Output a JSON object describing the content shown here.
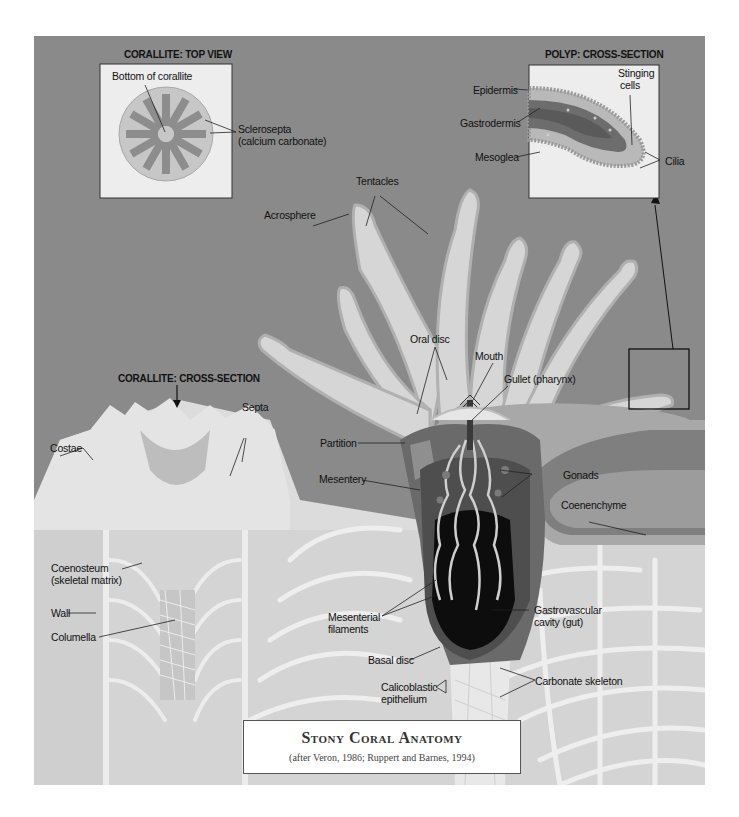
{
  "diagram": {
    "title": "Stony Coral Anatomy",
    "subtitle": "(after Veron, 1986; Ruppert and Barnes, 1994)",
    "colors": {
      "background": "#8a8a8a",
      "tissue_light": "#d6d6d6",
      "tissue_mid": "#b2b2b2",
      "tissue_dark": "#5e5e5e",
      "cavity": "#0d0d0d",
      "skeleton": "#e2e2e2",
      "inset_bg": "#ededed"
    },
    "insets": {
      "top_view": {
        "heading": "CORALLITE: TOP VIEW",
        "labels": {
          "bottom": "Bottom of corallite",
          "sclerosepta_1": "Sclerosepta",
          "sclerosepta_2": "(calcium carbonate)"
        }
      },
      "polyp_section": {
        "heading": "POLYP: CROSS-SECTION",
        "labels": {
          "stinging_1": "Stinging",
          "stinging_2": "cells",
          "epidermis": "Epidermis",
          "gastrodermis": "Gastrodermis",
          "mesoglea": "Mesoglea",
          "cilia": "Cilia"
        }
      }
    },
    "cross_section_heading": "CORALLITE: CROSS-SECTION",
    "labels": {
      "tentacles": "Tentacles",
      "acrosphere": "Acrosphere",
      "oral_disc": "Oral disc",
      "mouth": "Mouth",
      "gullet": "Gullet (pharynx)",
      "septa": "Septa",
      "costae": "Costae",
      "partition": "Partition",
      "mesentery": "Mesentery",
      "gonads": "Gonads",
      "coenenchyme": "Coenenchyme",
      "coenosteum_1": "Coenosteum",
      "coenosteum_2": "(skeletal matrix)",
      "wall": "Wall",
      "columella": "Columella",
      "mesenterial_1": "Mesenterial",
      "mesenterial_2": "filaments",
      "gastro_1": "Gastrovascular",
      "gastro_2": "cavity (gut)",
      "basal_disc": "Basal disc",
      "calico_1": "Calicoblastic",
      "calico_2": "epithelium",
      "carbonate": "Carbonate skeleton"
    }
  }
}
